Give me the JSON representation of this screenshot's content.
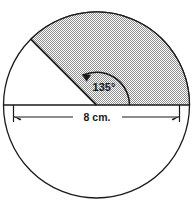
{
  "figure": {
    "type": "circle-sector-diagram",
    "background_color": "#ffffff",
    "stroke_color": "#1a1a1a",
    "shading_color": "#c8c8c8",
    "circle": {
      "center_x": 96.5,
      "center_y": 105,
      "radius": 93
    },
    "sector": {
      "start_angle_deg": 0,
      "end_angle_deg": 135,
      "shaded": true
    },
    "angle": {
      "value": "135",
      "degree_symbol": "°",
      "label": "135°"
    },
    "dimension": {
      "label": "8 cm.",
      "value": "8",
      "unit": "cm.",
      "measures": "diameter"
    }
  }
}
